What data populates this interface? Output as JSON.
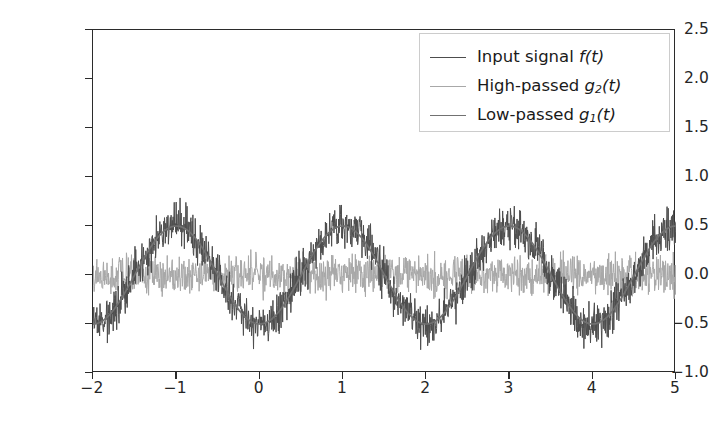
{
  "chart_data": {
    "type": "line",
    "title": "",
    "xlabel": "",
    "ylabel": "",
    "xlim": [
      -2.0,
      5.0
    ],
    "ylim": [
      -1.0,
      2.5
    ],
    "grid": false,
    "legend_position": "upper right",
    "xticks": [
      -2,
      -1,
      0,
      1,
      2,
      3,
      4,
      5
    ],
    "xtick_labels": [
      "−2",
      "−1",
      "0",
      "1",
      "2",
      "3",
      "4",
      "5"
    ],
    "yticks": [
      -1.0,
      -0.5,
      0.0,
      0.5,
      1.0,
      1.5,
      2.0,
      2.5
    ],
    "ytick_labels": [
      "−1.0",
      "−0.5",
      "0.0",
      "0.5",
      "1.0",
      "1.5",
      "2.0",
      "2.5"
    ],
    "series": [
      {
        "name": "input-signal",
        "legend_label": "Input signal f(t)",
        "color": "#4d4d4d",
        "linewidth": 1.0,
        "description": "Noisy sinusoid: low-frequency sine of amplitude 0.5 plus broadband noise of amplitude 0.17",
        "model": {
          "kind": "sine_plus_noise",
          "amplitude": 0.5,
          "period": 2.0,
          "phase_offset": 1.5,
          "noise_amplitude": 0.17,
          "noise_seed": 7
        },
        "approx_peak": 0.72,
        "approx_trough": -0.72
      },
      {
        "name": "high-passed",
        "legend_label": "High-passed g2(t)",
        "color": "#a8a8a8",
        "linewidth": 1.0,
        "description": "Residual high-frequency noise band centred on zero",
        "model": {
          "kind": "noise",
          "amplitude": 0.155,
          "mean": 0.0,
          "noise_seed": 21
        },
        "approx_peak": 0.18,
        "approx_trough": -0.18
      },
      {
        "name": "low-passed",
        "legend_label": "Low-passed g1(t)",
        "color": "#717171",
        "linewidth": 1.7,
        "description": "Smooth recovered sinusoid, amplitude 0.5, period 2, starting near zero at t=-2",
        "model": {
          "kind": "sine",
          "amplitude": 0.5,
          "period": 2.0,
          "phase_offset": 1.5
        },
        "approx_peak": 0.5,
        "approx_trough": -0.5,
        "value_at_xmax": 0.35
      }
    ]
  },
  "legend": {
    "entries": [
      {
        "label_prefix": "Input signal ",
        "symbol": "f",
        "sub": "",
        "suffix": "(t)",
        "color": "#4d4d4d",
        "width": 1.2
      },
      {
        "label_prefix": "High-passed ",
        "symbol": "g",
        "sub": "2",
        "suffix": "(t)",
        "color": "#a8a8a8",
        "width": 1.2
      },
      {
        "label_prefix": "Low-passed ",
        "symbol": "g",
        "sub": "1",
        "suffix": "(t)",
        "color": "#717171",
        "width": 1.8
      }
    ]
  },
  "axes": {
    "spine_color": "#2b2b2b",
    "tick_label_color": "#262626",
    "background": "#ffffff"
  }
}
